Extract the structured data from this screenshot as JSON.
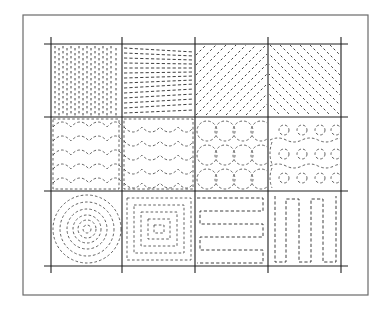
{
  "figure": {
    "frame": {
      "x": 23,
      "y": 15,
      "width": 345,
      "height": 280,
      "color": "#6a6a6a"
    },
    "grid": {
      "columns_x": [
        51,
        122,
        195,
        268,
        341
      ],
      "rows_y": [
        44,
        117,
        191,
        266
      ],
      "overhang": 7,
      "line_color": "#1e1e1e"
    },
    "stitch_color": "#2a2a2a",
    "cells": [
      {
        "row": 1,
        "col": 1,
        "pattern": "vertical-parallel-dashes"
      },
      {
        "row": 1,
        "col": 2,
        "pattern": "horizontal-converging-dashes"
      },
      {
        "row": 1,
        "col": 3,
        "pattern": "diagonal-dashes-rising"
      },
      {
        "row": 1,
        "col": 4,
        "pattern": "diagonal-dashes-falling"
      },
      {
        "row": 2,
        "col": 1,
        "pattern": "clamshell-scallops"
      },
      {
        "row": 2,
        "col": 2,
        "pattern": "offset-clamshell-scallops"
      },
      {
        "row": 2,
        "col": 3,
        "pattern": "overlapping-circles-grid"
      },
      {
        "row": 2,
        "col": 4,
        "pattern": "small-circles-with-wavy-bands"
      },
      {
        "row": 3,
        "col": 1,
        "pattern": "concentric-circles"
      },
      {
        "row": 3,
        "col": 2,
        "pattern": "concentric-squares"
      },
      {
        "row": 3,
        "col": 3,
        "pattern": "horizontal-serpentine"
      },
      {
        "row": 3,
        "col": 4,
        "pattern": "vertical-serpentine"
      }
    ]
  }
}
